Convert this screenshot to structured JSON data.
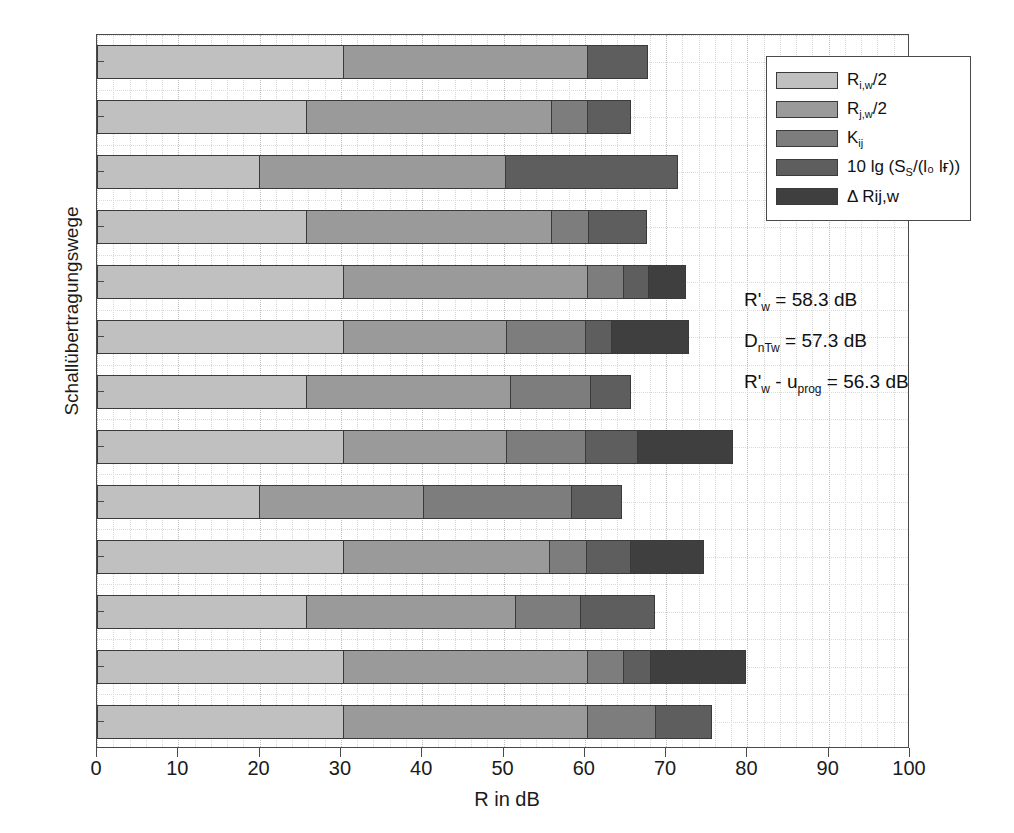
{
  "chart_data": {
    "type": "bar",
    "orientation": "horizontal",
    "stacked": true,
    "title": "",
    "xlabel": "R in dB",
    "ylabel": "Schallübertragungswege",
    "xlim": [
      0,
      100
    ],
    "xticks": [
      0,
      10,
      20,
      30,
      40,
      50,
      60,
      70,
      80,
      90,
      100
    ],
    "xtick_labels": [
      "0",
      "10",
      "20",
      "30",
      "40",
      "50",
      "60",
      "70",
      "80",
      "90",
      "100"
    ],
    "grid": true,
    "grid_axis": "both",
    "legend_position": "top-right",
    "categories": [
      "Dd",
      "1d",
      "2d",
      "3d",
      "4d",
      "D1",
      "11",
      "D2",
      "22",
      "D3",
      "33",
      "D4",
      "44"
    ],
    "series": [
      {
        "name": "R_iw_half",
        "label": "R i,w /2",
        "color": "#c0c0c0",
        "values": [
          30.4,
          25.8,
          20.0,
          25.8,
          30.4,
          30.4,
          25.8,
          30.4,
          20.0,
          30.4,
          25.8,
          30.4,
          30.4
        ]
      },
      {
        "name": "R_jw_half",
        "label": "R j,w /2",
        "color": "#9a9a9a",
        "values": [
          30.1,
          30.3,
          30.4,
          30.3,
          30.1,
          20.1,
          25.3,
          20.1,
          20.3,
          25.5,
          25.8,
          30.1,
          30.1
        ]
      },
      {
        "name": "K_ij",
        "label": "K ij",
        "color": "#7d7d7d",
        "values": [
          0.0,
          4.5,
          0.0,
          4.7,
          4.6,
          9.9,
          9.9,
          9.9,
          18.4,
          4.6,
          8.2,
          4.6,
          8.5
        ]
      },
      {
        "name": "ten_lg_S",
        "label": "10 lg (S S /(l 0 l f ))",
        "color": "#5e5e5e",
        "values": [
          7.5,
          5.4,
          21.3,
          7.2,
          3.2,
          3.3,
          5.0,
          6.5,
          6.3,
          5.6,
          9.2,
          3.4,
          7.0
        ]
      },
      {
        "name": "delta_Rij_w",
        "label": "Δ Rij,w",
        "color": "#3f3f3f",
        "values": [
          0.0,
          0.0,
          0.0,
          0.0,
          4.7,
          9.6,
          0.0,
          11.8,
          0.0,
          9.0,
          0.0,
          11.8,
          0.0
        ]
      }
    ],
    "totals": [
      68.0,
      66.0,
      71.7,
      68.0,
      73.0,
      73.3,
      66.0,
      78.7,
      65.0,
      75.1,
      69.0,
      80.3,
      76.0
    ]
  },
  "legend": {
    "items": [
      {
        "swatch_color": "#c0c0c0",
        "text_main": "R",
        "text_sub": "i,w",
        "text_tail": "/2",
        "icon": "legend-swatch-icon"
      },
      {
        "swatch_color": "#9a9a9a",
        "text_main": "R",
        "text_sub": "j,w",
        "text_tail": "/2",
        "icon": "legend-swatch-icon"
      },
      {
        "swatch_color": "#7d7d7d",
        "text_main": "K",
        "text_sub": "ij",
        "text_tail": "",
        "icon": "legend-swatch-icon"
      },
      {
        "swatch_color": "#5e5e5e",
        "text_main": "10 lg (S",
        "text_sub": "S",
        "text_tail": "/(l₀ lғ))",
        "icon": "legend-swatch-icon"
      },
      {
        "swatch_color": "#3f3f3f",
        "text_main": "Δ Rij,w",
        "text_sub": "",
        "text_tail": "",
        "icon": "legend-swatch-icon"
      }
    ]
  },
  "annotations": {
    "line1": {
      "sym": "R'",
      "sub": "w",
      "rest": "= 58.3 dB",
      "value": "58.3",
      "unit": "dB"
    },
    "line2": {
      "sym": "D",
      "sub": "nTw",
      "rest": "= 57.3 dB",
      "value": "57.3",
      "unit": "dB"
    },
    "line3": {
      "sym": "R'",
      "sub": "w",
      "mid": "- u",
      "sub2": "prog",
      "rest": "= 56.3 dB",
      "value": "56.3",
      "unit": "dB"
    }
  },
  "axes": {
    "x_label": "R in dB",
    "y_label": "Schallübertragungswege"
  }
}
